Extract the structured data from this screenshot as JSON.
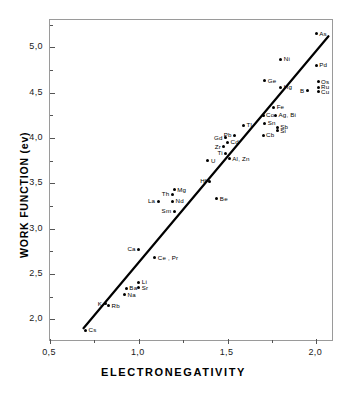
{
  "chart_data": {
    "type": "scatter",
    "title": "",
    "xlabel": "ELECTRONEGATIVITY",
    "ylabel": "WORK FUNCTION  (ev)",
    "xlim": [
      0.5,
      2.1
    ],
    "ylim": [
      1.75,
      5.3
    ],
    "grid": false,
    "legend": "none",
    "x_ticks": [
      {
        "value": 0.5,
        "label": "0,5"
      },
      {
        "value": 1.0,
        "label": "1,0"
      },
      {
        "value": 1.5,
        "label": "1,5"
      },
      {
        "value": 2.0,
        "label": "2,0"
      }
    ],
    "x_minor_ticks": [
      0.75,
      1.25,
      1.75
    ],
    "y_ticks": [
      {
        "value": 2.0,
        "label": "2,0"
      },
      {
        "value": 2.5,
        "label": "2,5"
      },
      {
        "value": 3.0,
        "label": "3,0"
      },
      {
        "value": 3.5,
        "label": "3,5"
      },
      {
        "value": 4.0,
        "label": "4,0"
      },
      {
        "value": 4.5,
        "label": "4,5"
      },
      {
        "value": 5.0,
        "label": "5,0"
      }
    ],
    "y_minor_ticks": [
      2.25,
      2.75,
      3.25,
      3.75,
      4.25,
      4.75,
      5.25
    ],
    "fit_line": {
      "x1": 0.69,
      "y1": 1.88,
      "x2": 2.08,
      "y2": 5.12
    },
    "points": [
      {
        "label": "Cs",
        "x": 0.7,
        "y": 1.88,
        "side": "right"
      },
      {
        "label": "K",
        "x": 0.81,
        "y": 2.17,
        "side": "left"
      },
      {
        "label": "Rb",
        "x": 0.83,
        "y": 2.15,
        "side": "right"
      },
      {
        "label": "Na",
        "x": 0.92,
        "y": 2.27,
        "side": "right"
      },
      {
        "label": "Ba",
        "x": 0.93,
        "y": 2.34,
        "side": "right"
      },
      {
        "label": "Sr",
        "x": 1.0,
        "y": 2.35,
        "side": "right"
      },
      {
        "label": "Li",
        "x": 1.0,
        "y": 2.41,
        "side": "right"
      },
      {
        "label": "Ca",
        "x": 1.0,
        "y": 2.77,
        "side": "left"
      },
      {
        "label": "Ce , Pr",
        "x": 1.09,
        "y": 2.68,
        "side": "right"
      },
      {
        "label": "La",
        "x": 1.11,
        "y": 3.3,
        "side": "left"
      },
      {
        "label": "Sm",
        "x": 1.2,
        "y": 3.19,
        "side": "left"
      },
      {
        "label": "Nd",
        "x": 1.19,
        "y": 3.3,
        "side": "right"
      },
      {
        "label": "Th",
        "x": 1.19,
        "y": 3.38,
        "side": "left"
      },
      {
        "label": "Mg",
        "x": 1.2,
        "y": 3.43,
        "side": "right"
      },
      {
        "label": "Be",
        "x": 1.44,
        "y": 3.33,
        "side": "right"
      },
      {
        "label": "Hf",
        "x": 1.4,
        "y": 3.52,
        "side": "left"
      },
      {
        "label": "U",
        "x": 1.39,
        "y": 3.75,
        "side": "right"
      },
      {
        "label": "Ti",
        "x": 1.49,
        "y": 3.83,
        "side": "left"
      },
      {
        "label": "Zr",
        "x": 1.48,
        "y": 3.9,
        "side": "left"
      },
      {
        "label": "Al, Zn",
        "x": 1.51,
        "y": 3.77,
        "side": "right"
      },
      {
        "label": "Cd",
        "x": 1.5,
        "y": 3.95,
        "side": "right"
      },
      {
        "label": "Gd",
        "x": 1.49,
        "y": 4.0,
        "side": "left"
      },
      {
        "label": "Pb",
        "x": 1.54,
        "y": 4.03,
        "side": "left"
      },
      {
        "label": "Tl",
        "x": 1.59,
        "y": 4.14,
        "side": "right"
      },
      {
        "label": "Cb",
        "x": 1.7,
        "y": 4.03,
        "side": "right"
      },
      {
        "label": "Sn",
        "x": 1.71,
        "y": 4.16,
        "side": "right"
      },
      {
        "label": "Co",
        "x": 1.7,
        "y": 4.25,
        "side": "right"
      },
      {
        "label": "Ag, Bi",
        "x": 1.77,
        "y": 4.25,
        "side": "right"
      },
      {
        "label": "Sb",
        "x": 1.78,
        "y": 4.12,
        "side": "right"
      },
      {
        "label": "Si",
        "x": 1.78,
        "y": 4.08,
        "side": "right"
      },
      {
        "label": "Fe",
        "x": 1.76,
        "y": 4.34,
        "side": "right"
      },
      {
        "label": "Ge",
        "x": 1.71,
        "y": 4.63,
        "side": "right"
      },
      {
        "label": "Hg",
        "x": 1.8,
        "y": 4.56,
        "side": "right"
      },
      {
        "label": "Ni",
        "x": 1.8,
        "y": 4.87,
        "side": "right"
      },
      {
        "label": "B",
        "x": 1.95,
        "y": 4.52,
        "side": "left"
      },
      {
        "label": "Cu",
        "x": 2.01,
        "y": 4.51,
        "side": "right"
      },
      {
        "label": "Ru",
        "x": 2.01,
        "y": 4.56,
        "side": "right"
      },
      {
        "label": "Os",
        "x": 2.01,
        "y": 4.62,
        "side": "right"
      },
      {
        "label": "Pd",
        "x": 2.0,
        "y": 4.8,
        "side": "right"
      },
      {
        "label": "As",
        "x": 2.0,
        "y": 5.15,
        "side": "right"
      }
    ]
  },
  "colors": {
    "marker": "#000000",
    "fit_line": "#000000",
    "frame": "#9a9a9a",
    "text": "#111111"
  }
}
